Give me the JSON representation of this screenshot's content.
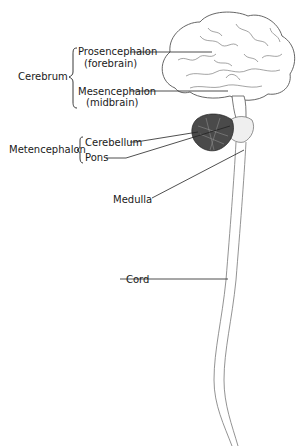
{
  "diagram": {
    "type": "anatomy",
    "groups": [
      {
        "label": "Cerebrum",
        "members": [
          {
            "label": "Prosencephalon",
            "sub": "(forebrain)"
          },
          {
            "label": "Mesencephalon",
            "sub": "(midbrain)"
          }
        ]
      },
      {
        "label": "Metencephalon",
        "members": [
          {
            "label": "Cerebellum"
          },
          {
            "label": "Pons"
          }
        ]
      }
    ],
    "labels": {
      "cerebrum": "Cerebrum",
      "prosencephalon": "Prosencephalon",
      "forebrain": "(forebrain)",
      "mesencephalon": "Mesencephalon",
      "midbrain": "(midbrain)",
      "metencephalon": "Metencephalon",
      "cerebellum": "Cerebellum",
      "pons": "Pons",
      "medulla": "Medulla",
      "cord": "Cord"
    }
  }
}
